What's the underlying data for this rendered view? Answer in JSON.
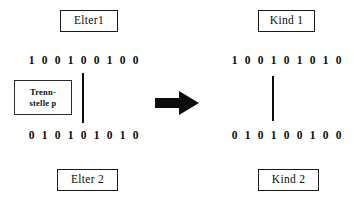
{
  "diagram": {
    "type": "one-point-crossover",
    "parents": {
      "parent1": {
        "label": "Elter1",
        "bits": [
          "1",
          "0",
          "0",
          "1",
          "0",
          "0",
          "1",
          "0",
          "0"
        ]
      },
      "parent2": {
        "label": "Elter 2",
        "bits": [
          "0",
          "1",
          "0",
          "1",
          "0",
          "1",
          "0",
          "1",
          "0"
        ]
      }
    },
    "children": {
      "child1": {
        "label": "Kind 1",
        "bits": [
          "1",
          "0",
          "0",
          "1",
          "0",
          "1",
          "0",
          "1",
          "0"
        ]
      },
      "child2": {
        "label": "Kind 2",
        "bits": [
          "0",
          "1",
          "0",
          "1",
          "0",
          "0",
          "1",
          "0",
          "0"
        ]
      }
    },
    "crossover_marker": {
      "line1": "Trenn-",
      "line2": "stelle p"
    },
    "arrow": {
      "icon": "arrow-right-icon"
    },
    "colors": {
      "ink": "#0d0d0d",
      "border": "#1a1a1a",
      "background": "#ffffff"
    }
  }
}
